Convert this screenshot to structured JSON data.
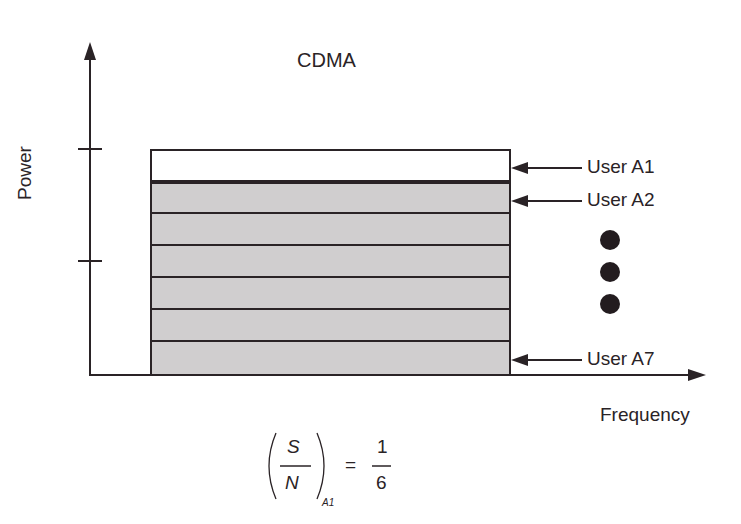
{
  "diagram": {
    "title": "CDMA",
    "y_axis_label": "Power",
    "x_axis_label": "Frequency",
    "users": [
      {
        "label": "User A1",
        "fill": "#ffffff"
      },
      {
        "label": "User A2",
        "fill": "#d0cecf"
      },
      {
        "label": "",
        "fill": "#d0cecf"
      },
      {
        "label": "",
        "fill": "#d0cecf"
      },
      {
        "label": "",
        "fill": "#d0cecf"
      },
      {
        "label": "",
        "fill": "#d0cecf"
      },
      {
        "label": "User A7",
        "fill": "#d0cecf"
      }
    ],
    "ellipsis": "three vertical dots",
    "formula": {
      "numerator": "S",
      "denominator": "N",
      "subscript": "A1",
      "equals": "=",
      "value_numerator": "1",
      "value_denominator": "6"
    },
    "colors": {
      "line": "#2a2326",
      "band_fill": "#d0cecf",
      "background": "#ffffff"
    }
  }
}
